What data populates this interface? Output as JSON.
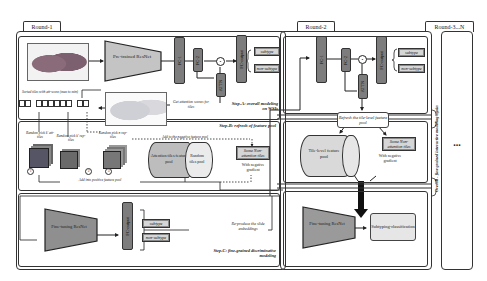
{
  "rounds": {
    "round1": "Round-1",
    "round2": "Round-2",
    "round3": "Round-3...N"
  },
  "round1": {
    "wsi_caption": "",
    "pretrained": "Pre-trained ResNet",
    "fc1": "FC-1",
    "fc2": "FC-2",
    "attn": "ATTN",
    "fc_output": "FC-output",
    "subtype": "subtype",
    "non_subtype": "non-subtype",
    "get_attention": "Get attention scores for tiles",
    "step_a": "Step-A: overall modeling on WSIs",
    "sorted_tiles": "Sorted tiles with att-score (max to min)",
    "step_b": "Step-B: refresh of feature pool",
    "pick1": "Random pick k' att-tiles",
    "pick2": "Random pick k' rep-tiles",
    "pick3": "Random pick n rep-tiles",
    "add_negative": "Add to the negative feature pool",
    "add_positive": "Add into positive feature pool",
    "attention_pool": "Attention tiles feature pool",
    "random_pool": "Random tiles pool",
    "some_non_attention": "Some Non-attention tiles",
    "with_negative_gradient": "With negative gradient",
    "circle_labels": [
      "1",
      "2",
      "3"
    ],
    "finetuning": "Fine-tuning ResNet",
    "fc_output2": "FC-output",
    "subtype2": "subtype",
    "non_subtype2": "non-subtype",
    "reproduce": "Re-produce the slide embeddings",
    "step_c": "Step-C: fine-grained discriminative modeling"
  },
  "round2": {
    "fc1": "FC-1",
    "fc2": "FC-2",
    "attn": "ATTN",
    "fc_output": "FC-output",
    "subtype": "subtype",
    "non_subtype": "non-subtype",
    "refresh": "Refresh the tile-level feature pool",
    "tile_pool": "Tile-level feature pool",
    "some_non_attention": "Some Non-attention tiles",
    "with_negative_gradient": "With negative gradient",
    "finetuning": "Fine-tuning ResNet",
    "subtyping": "Subtyping-classification"
  },
  "side": {
    "vertical_label": "Overall - fine grained interactive modeling again",
    "ellipsis": "..."
  }
}
